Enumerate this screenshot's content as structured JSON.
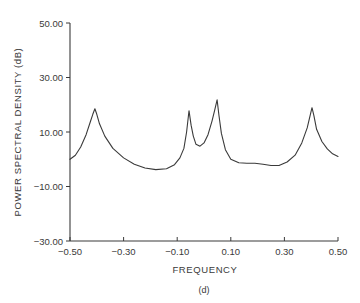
{
  "chart_data": {
    "type": "line",
    "title": "",
    "caption": "(d)",
    "xlabel": "FREQUENCY",
    "ylabel": "POWER SPECTRAL DENSITY (dB)",
    "xlim": [
      -0.5,
      0.5
    ],
    "ylim": [
      -30,
      50
    ],
    "grid": false,
    "legend": null,
    "x_ticks": [
      "−0.50",
      "−0.30",
      "−0.10",
      "0.10",
      "0.30",
      "0.50"
    ],
    "x_tick_values": [
      -0.5,
      -0.3,
      -0.1,
      0.1,
      0.3,
      0.5
    ],
    "y_ticks": [
      "50.00",
      "30.00",
      "10.00",
      "−10.00",
      "−30.00"
    ],
    "y_tick_values": [
      50,
      30,
      10,
      -10,
      -30
    ],
    "series": [
      {
        "name": "PSD",
        "color": "#3a3a3a",
        "x": [
          -0.5,
          -0.48,
          -0.46,
          -0.44,
          -0.425,
          -0.415,
          -0.407,
          -0.4,
          -0.39,
          -0.37,
          -0.34,
          -0.3,
          -0.26,
          -0.22,
          -0.18,
          -0.14,
          -0.11,
          -0.09,
          -0.075,
          -0.065,
          -0.056,
          -0.048,
          -0.04,
          -0.03,
          -0.015,
          0.0,
          0.015,
          0.03,
          0.04,
          0.049,
          0.056,
          0.065,
          0.08,
          0.1,
          0.13,
          0.16,
          0.19,
          0.22,
          0.25,
          0.28,
          0.31,
          0.34,
          0.365,
          0.385,
          0.397,
          0.403,
          0.41,
          0.42,
          0.44,
          0.46,
          0.48,
          0.5
        ],
        "values": [
          0.0,
          1.5,
          4.5,
          9.0,
          13.5,
          16.5,
          18.5,
          16.5,
          13.0,
          8.5,
          4.0,
          0.5,
          -1.8,
          -3.2,
          -3.8,
          -3.5,
          -2.0,
          0.5,
          4.0,
          10.0,
          17.8,
          12.5,
          8.5,
          5.5,
          4.8,
          6.0,
          9.0,
          14.0,
          18.0,
          21.8,
          16.0,
          9.5,
          3.5,
          0.0,
          -1.3,
          -1.5,
          -1.5,
          -1.8,
          -2.3,
          -2.3,
          -1.0,
          1.5,
          6.0,
          11.5,
          16.5,
          18.9,
          16.0,
          11.0,
          6.5,
          3.8,
          2.0,
          1.0
        ]
      }
    ],
    "peaks": [
      {
        "x": -0.407,
        "y": 18.5
      },
      {
        "x": -0.056,
        "y": 17.8
      },
      {
        "x": 0.049,
        "y": 21.8
      },
      {
        "x": 0.403,
        "y": 18.9
      }
    ]
  }
}
